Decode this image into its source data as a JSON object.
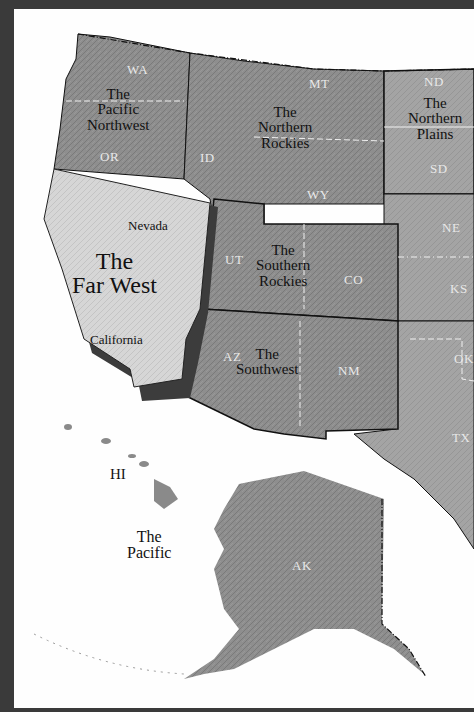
{
  "map": {
    "title": "Regions of the Western United States",
    "regions": [
      {
        "id": "pacific-northwest",
        "line1": "The",
        "line2": "Pacific",
        "line3": "Northwest"
      },
      {
        "id": "northern-rockies",
        "line1": "The",
        "line2": "Northern",
        "line3": "Rockies"
      },
      {
        "id": "northern-plains",
        "line1": "The",
        "line2": "Northern",
        "line3": "Plains"
      },
      {
        "id": "far-west",
        "line1": "The",
        "line2": "Far West"
      },
      {
        "id": "southern-rockies",
        "line1": "The",
        "line2": "Southern",
        "line3": "Rockies"
      },
      {
        "id": "southwest",
        "line1": "The",
        "line2": "Southwest"
      },
      {
        "id": "pacific",
        "line1": "The",
        "line2": "Pacific"
      }
    ],
    "sublabels": {
      "nevada": "Nevada",
      "california": "California"
    },
    "states": {
      "wa": "WA",
      "or": "OR",
      "id": "ID",
      "mt": "MT",
      "wy": "WY",
      "nd": "ND",
      "sd": "SD",
      "ne": "NE",
      "ks": "KS",
      "ut": "UT",
      "co": "CO",
      "az": "AZ",
      "nm": "NM",
      "ok": "OK",
      "tx": "TX",
      "hi": "HI",
      "ak": "AK"
    },
    "colors": {
      "frame": "#3a3a3a",
      "land": "#8c8c8c",
      "far_west": "#d8d8d8",
      "water": "#fefefe",
      "border": "#111111"
    }
  }
}
